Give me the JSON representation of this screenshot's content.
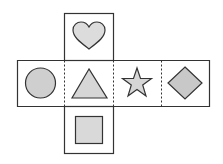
{
  "diagram": {
    "type": "cube-net",
    "faces": [
      {
        "position": "top",
        "shape": "heart",
        "fill": "#dcdcdc"
      },
      {
        "position": "middle-left",
        "shape": "circle",
        "fill": "#cfcfcf"
      },
      {
        "position": "middle-center",
        "shape": "triangle",
        "fill": "#d6d6d6"
      },
      {
        "position": "middle-right",
        "shape": "star",
        "fill": "#d6d6d6"
      },
      {
        "position": "far-right",
        "shape": "diamond",
        "fill": "#c8c8c8"
      },
      {
        "position": "bottom",
        "shape": "square",
        "fill": "#d9d9d9"
      }
    ],
    "colors": {
      "stroke": "#333333",
      "background": "#ffffff"
    }
  }
}
